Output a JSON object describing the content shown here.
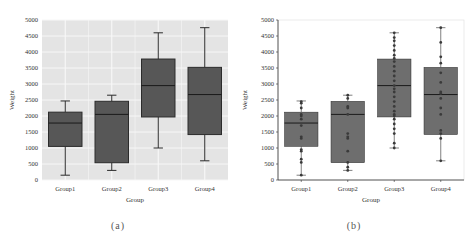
{
  "panels": [
    {
      "id": "a",
      "caption": "(a)",
      "style": "seaborn-grid",
      "show_points": false
    },
    {
      "id": "b",
      "caption": "(b)",
      "style": "plain-axes",
      "show_points": true
    }
  ],
  "colors": {
    "box_fill_a": "#575757",
    "box_fill_b": "#6e6e6e",
    "plot_bg_a": "#e4e4e4",
    "grid_a": "#f7f7f7",
    "line": "#2b2b2b",
    "point": "#3a3a3a"
  },
  "chart_data": [
    {
      "type": "box",
      "panel": "a",
      "title": "",
      "xlabel": "Group",
      "ylabel": "Weight",
      "ylim": [
        0,
        5000
      ],
      "yticks": [
        0,
        500,
        1000,
        1500,
        2000,
        2500,
        3000,
        3500,
        4000,
        4500,
        5000
      ],
      "grid": true,
      "categories": [
        "Group1",
        "Group2",
        "Group3",
        "Group4"
      ],
      "series": [
        {
          "name": "Group1",
          "min": 150,
          "q1": 1050,
          "median": 1780,
          "q3": 2120,
          "max": 2470
        },
        {
          "name": "Group2",
          "min": 300,
          "q1": 540,
          "median": 2050,
          "q3": 2460,
          "max": 2650
        },
        {
          "name": "Group3",
          "min": 1000,
          "q1": 1970,
          "median": 2950,
          "q3": 3780,
          "max": 4600
        },
        {
          "name": "Group4",
          "min": 600,
          "q1": 1420,
          "median": 2670,
          "q3": 3520,
          "max": 4760
        }
      ]
    },
    {
      "type": "box",
      "panel": "b",
      "title": "",
      "xlabel": "Group",
      "ylabel": "Weight",
      "ylim": [
        0,
        5000
      ],
      "yticks": [
        0,
        500,
        1000,
        1500,
        2000,
        2500,
        3000,
        3500,
        4000,
        4500,
        5000
      ],
      "grid": false,
      "categories": [
        "Group1",
        "Group2",
        "Group3",
        "Group4"
      ],
      "series": [
        {
          "name": "Group1",
          "min": 150,
          "q1": 1050,
          "median": 1780,
          "q3": 2120,
          "max": 2470,
          "points": [
            150,
            550,
            650,
            900,
            950,
            1300,
            1350,
            1700,
            1900,
            2000,
            2050,
            2250,
            2400,
            2450
          ]
        },
        {
          "name": "Group2",
          "min": 300,
          "q1": 540,
          "median": 2050,
          "q3": 2460,
          "max": 2650,
          "points": [
            300,
            400,
            550,
            900,
            1300,
            1350,
            1450,
            2050,
            2250,
            2300,
            2550,
            2650
          ]
        },
        {
          "name": "Group3",
          "min": 1000,
          "q1": 1970,
          "median": 2950,
          "q3": 3780,
          "max": 4600,
          "points": [
            1000,
            1150,
            1450,
            1600,
            1750,
            1900,
            2000,
            2050,
            2150,
            2300,
            2450,
            2600,
            2750,
            2850,
            2950,
            3100,
            3250,
            3400,
            3550,
            3700,
            3800,
            3900,
            4050,
            4200,
            4350,
            4450,
            4600
          ]
        },
        {
          "name": "Group4",
          "min": 600,
          "q1": 1420,
          "median": 2670,
          "q3": 3520,
          "max": 4760,
          "points": [
            600,
            1300,
            1450,
            1550,
            2050,
            2250,
            2550,
            2700,
            2750,
            3050,
            3350,
            3650,
            3850,
            4300,
            4760
          ]
        }
      ]
    }
  ]
}
